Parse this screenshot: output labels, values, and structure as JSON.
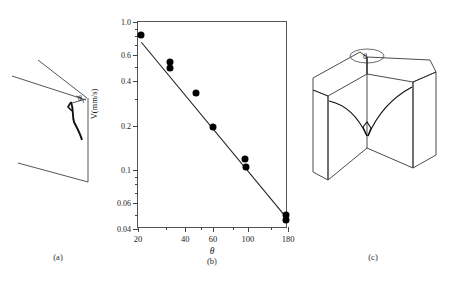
{
  "figure": {
    "panels": [
      {
        "id": "a",
        "label": "(a)",
        "description": "2D schematic of wedge crack with theta angle",
        "angle_symbol": "θ"
      },
      {
        "id": "b",
        "label": "(b)",
        "description": "log-log plot of crack velocity versus theta"
      },
      {
        "id": "c",
        "label": "(c)",
        "description": "3D block diagram of corner with crack front",
        "angle_symbol": "θ"
      }
    ]
  },
  "chart_data": {
    "type": "scatter",
    "title": "",
    "xlabel": "θ",
    "ylabel": "V(mm/s)",
    "xscale": "log",
    "yscale": "log",
    "xlim": [
      20,
      180
    ],
    "ylim": [
      0.04,
      1.0
    ],
    "grid": false,
    "legend": null,
    "x_ticks_major": [
      20,
      40,
      60,
      100,
      180
    ],
    "x_tick_labels": [
      "20",
      "40",
      "60",
      "100",
      "180"
    ],
    "x_ticks_minor": [
      30,
      50,
      80,
      140
    ],
    "y_ticks_major": [
      0.04,
      0.06,
      0.1,
      0.2,
      0.4,
      0.6,
      1.0
    ],
    "y_tick_labels": [
      "0.04",
      "0.06",
      "0.1",
      "0.2",
      "0.4",
      "0.6",
      "1.0"
    ],
    "y_ticks_minor": [
      0.05,
      0.07,
      0.08,
      0.09,
      0.3,
      0.5,
      0.7,
      0.8,
      0.9
    ],
    "points": [
      {
        "x": 21,
        "y": 0.82
      },
      {
        "x": 32,
        "y": 0.54
      },
      {
        "x": 32,
        "y": 0.49
      },
      {
        "x": 47,
        "y": 0.33
      },
      {
        "x": 60,
        "y": 0.195
      },
      {
        "x": 96,
        "y": 0.118
      },
      {
        "x": 97,
        "y": 0.105
      },
      {
        "x": 175,
        "y": 0.05
      },
      {
        "x": 176,
        "y": 0.046
      }
    ],
    "fit_line": {
      "type": "power-law",
      "x_start": 21,
      "y_start": 0.73,
      "x_end": 178,
      "y_end": 0.047
    },
    "marker": {
      "shape": "circle",
      "color": "#000000",
      "size_px": 7
    },
    "line_color": "#222222"
  }
}
